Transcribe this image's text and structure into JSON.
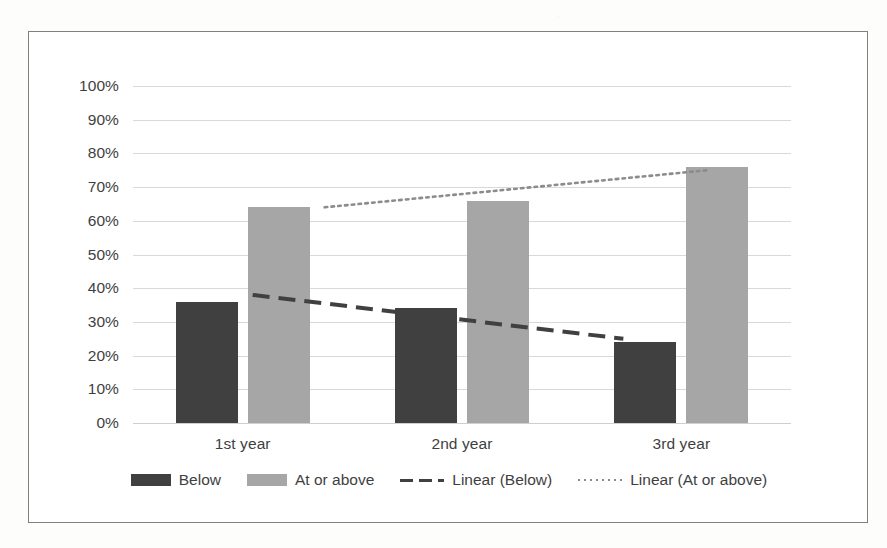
{
  "chart_data": {
    "type": "bar",
    "title": "",
    "subtitle": "",
    "xlabel": "",
    "ylabel": "",
    "categories": [
      "1st year",
      "2nd year",
      "3rd year"
    ],
    "series": [
      {
        "name": "Below",
        "values": [
          36,
          34,
          24
        ],
        "color": "#404040"
      },
      {
        "name": "At or above",
        "values": [
          64,
          66,
          76
        ],
        "color": "#a6a6a6"
      }
    ],
    "trendlines": [
      {
        "name": "Linear (Below)",
        "style": "dashed",
        "color": "#404040",
        "start": 38,
        "end": 25
      },
      {
        "name": "Linear (At or above)",
        "style": "dotted",
        "color": "#8c8c8c",
        "start": 64,
        "end": 75
      }
    ],
    "ylim": [
      0,
      100
    ],
    "ytick_labels": [
      "100%",
      "90%",
      "80%",
      "70%",
      "60%",
      "50%",
      "40%",
      "30%",
      "20%",
      "10%",
      "0%"
    ],
    "ytick_values": [
      100,
      90,
      80,
      70,
      60,
      50,
      40,
      30,
      20,
      10,
      0
    ],
    "grid": true,
    "legend_position": "bottom",
    "legend": [
      {
        "label": "Below",
        "marker": "box-dark"
      },
      {
        "label": "At or above",
        "marker": "box-light"
      },
      {
        "label": "Linear (Below)",
        "marker": "line-dashed"
      },
      {
        "label": "Linear (At or above)",
        "marker": "line-dotted"
      }
    ],
    "value_unit": "%"
  }
}
